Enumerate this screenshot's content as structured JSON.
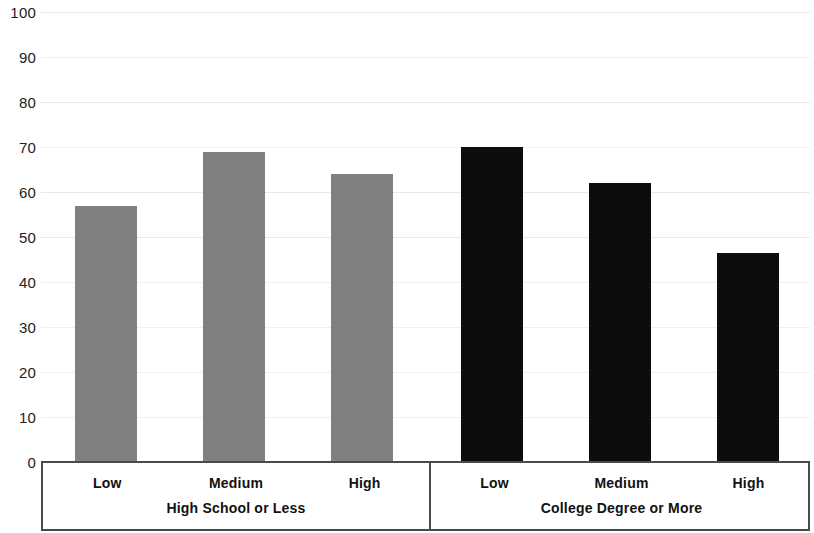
{
  "chart_data": {
    "type": "bar",
    "title": "",
    "subtitle": "",
    "xlabel": "",
    "ylabel": "",
    "ylim": [
      0,
      100
    ],
    "ytick_step": 10,
    "yticks": [
      100,
      90,
      80,
      70,
      60,
      50,
      40,
      30,
      20,
      10,
      0
    ],
    "grid": true,
    "grid_axis": "y",
    "legend": false,
    "legend_position": "none",
    "categories": [
      "Low",
      "Medium",
      "High"
    ],
    "groups": [
      {
        "label": "High School or Less",
        "color": "#808080",
        "categories": [
          "Low",
          "Medium",
          "High"
        ],
        "values": [
          57,
          69,
          64
        ]
      },
      {
        "label": "College Degree or More",
        "color": "#0d0d0d",
        "categories": [
          "Low",
          "Medium",
          "High"
        ],
        "values": [
          70,
          62,
          46.5
        ]
      }
    ],
    "bars": [
      {
        "group": "High School or Less",
        "category": "Low",
        "value": 57,
        "color": "#808080"
      },
      {
        "group": "High School or Less",
        "category": "Medium",
        "value": 69,
        "color": "#808080"
      },
      {
        "group": "High School or Less",
        "category": "High",
        "value": 64,
        "color": "#808080"
      },
      {
        "group": "College Degree or More",
        "category": "Low",
        "value": 70,
        "color": "#0d0d0d"
      },
      {
        "group": "College Degree or More",
        "category": "Medium",
        "value": 62,
        "color": "#0d0d0d"
      },
      {
        "group": "College Degree or More",
        "category": "High",
        "value": 46.5,
        "color": "#0d0d0d"
      }
    ]
  },
  "colors": {
    "gray_series": "#808080",
    "dark_series": "#0d0d0d",
    "axis": "#4a4a4a",
    "gridline": "#e9e9e9",
    "text": "#111111",
    "background": "#ffffff"
  }
}
